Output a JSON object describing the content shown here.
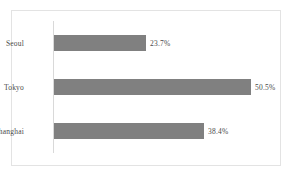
{
  "chart_data": {
    "type": "bar",
    "orientation": "horizontal",
    "title": "",
    "subtitle": "",
    "xlabel": "",
    "ylabel": "",
    "categories": [
      "Seoul",
      "Tokyo",
      "Shanghai"
    ],
    "values": [
      23.7,
      50.5,
      38.4
    ],
    "data_labels": [
      "23.7%",
      "50.5%",
      "38.4%"
    ],
    "series": [
      {
        "name": "",
        "values": [
          23.7,
          50.5,
          38.4
        ]
      }
    ],
    "xlim": [
      0,
      58
    ],
    "grid": false,
    "legend": false,
    "legend_position": "none",
    "tick_labels": [],
    "annotations": []
  },
  "style": {
    "bar_color": "#808080",
    "frame_border_color": "#e3e3e3",
    "axis_line_color": "#d9d9d9",
    "background_color": "#ffffff",
    "text_color": "#4a4a4a"
  }
}
